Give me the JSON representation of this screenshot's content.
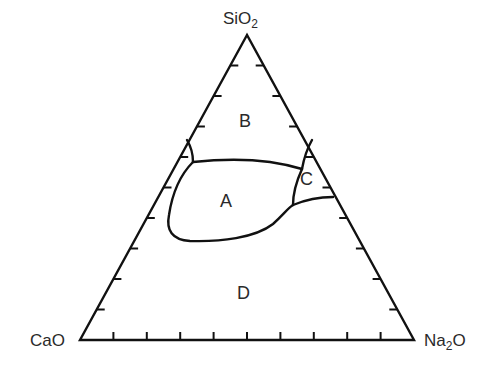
{
  "diagram": {
    "type": "ternary-phase-diagram",
    "vertices": {
      "top": {
        "base": "SiO",
        "sub": "2"
      },
      "left": {
        "base": "CaO",
        "sub": ""
      },
      "right": {
        "base": "Na",
        "sub": "2",
        "suffix": "O"
      }
    },
    "regions": [
      {
        "id": "A",
        "label": "A"
      },
      {
        "id": "B",
        "label": "B"
      },
      {
        "id": "C",
        "label": "C"
      },
      {
        "id": "D",
        "label": "D"
      }
    ],
    "tick_divisions": 10,
    "line_color": "#111111",
    "text_color": "#2a2a2a"
  }
}
